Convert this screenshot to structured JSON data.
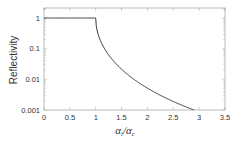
{
  "chart_data": {
    "type": "line",
    "title": "",
    "xlabel": "α_i/α_c",
    "xlabel_parts": {
      "main1": "α",
      "sub1": "i",
      "sep": "/",
      "main2": "α",
      "sub2": "c"
    },
    "ylabel": "Reflectivity",
    "xlim": [
      0,
      3.5
    ],
    "ylim": [
      0.001,
      2.15
    ],
    "yscale": "log",
    "grid": false,
    "legend": null,
    "x_ticks": [
      0,
      0.5,
      1,
      1.5,
      2,
      2.5,
      3,
      3.5
    ],
    "x_tick_labels": [
      "0",
      "0.5",
      "1",
      "1.5",
      "2",
      "2.5",
      "3",
      "3.5"
    ],
    "y_ticks": [
      1,
      0.1,
      0.01,
      0.001
    ],
    "y_tick_labels": [
      "1",
      "0.1",
      "0.01",
      "0.001"
    ],
    "series": [
      {
        "name": "Fresnel reflectivity",
        "color": "#333333",
        "x": [
          0,
          0.5,
          1.0,
          1.02,
          1.05,
          1.1,
          1.2,
          1.3,
          1.4,
          1.5,
          1.75,
          2.0,
          2.25,
          2.5,
          2.75,
          2.9
        ],
        "y": [
          1,
          1,
          1,
          0.67,
          0.53,
          0.41,
          0.22,
          0.104,
          0.0442,
          0.0213,
          0.0103,
          0.00515,
          0.00292,
          0.0018,
          0.00119,
          0.001
        ]
      }
    ]
  },
  "colors": {
    "axis": "#aaaaaa",
    "line": "#333333",
    "text": "#333333"
  }
}
